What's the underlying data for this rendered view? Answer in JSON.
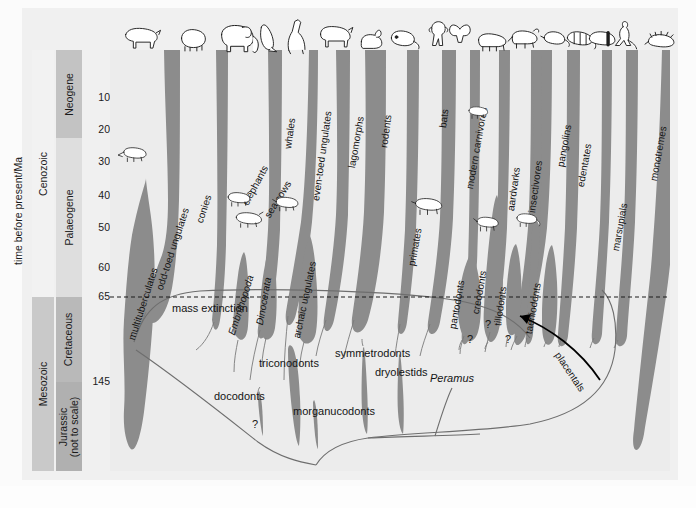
{
  "axis": {
    "title": "time before present/Ma",
    "ticks": [
      {
        "label": "10",
        "y": 48
      },
      {
        "label": "20",
        "y": 80
      },
      {
        "label": "30",
        "y": 112
      },
      {
        "label": "40",
        "y": 146
      },
      {
        "label": "50",
        "y": 178
      },
      {
        "label": "60",
        "y": 218
      },
      {
        "label": "65",
        "y": 247
      },
      {
        "label": "145",
        "y": 332
      }
    ]
  },
  "eras": [
    {
      "name": "Cenozoic"
    },
    {
      "name": "Mesozoic"
    }
  ],
  "periods": [
    {
      "name": "Neogene"
    },
    {
      "name": "Palaeogene"
    },
    {
      "name": "Cretaceous"
    },
    {
      "name": "Jurassic\n(not to scale)",
      "line1": "Jurassic",
      "line2": "(not to scale)"
    }
  ],
  "annotations": {
    "mass_extinction": "mass extinction",
    "placentals": "placentals",
    "question_marks": [
      "?",
      "?",
      "?",
      "?"
    ]
  },
  "colors": {
    "spindle": "#8c8c8c",
    "plot_background": "#ececec",
    "plate_background": "#f0f0f0",
    "neogene": "#c3c3c3",
    "palaeogene": "#dedede",
    "cretaceous": "#b9b9b9",
    "jurassic": "#b0b0b0",
    "mesozoic": "#c9c9c9",
    "cenozoic": "#f2f2f2",
    "text": "#141414",
    "boundary_line": "#1a1a1a"
  },
  "chart_data": {
    "type": "area",
    "xlabel": "",
    "ylabel": "time before present/Ma",
    "ylim": [
      0,
      145
    ],
    "grid": false,
    "legend": "none",
    "boundary_events": [
      {
        "label": "mass extinction",
        "age_ma": 65,
        "style": "dashed"
      }
    ],
    "eras": [
      {
        "name": "Cenozoic",
        "from_ma": 0,
        "to_ma": 65
      },
      {
        "name": "Mesozoic",
        "from_ma": 65,
        "to_ma": 145
      }
    ],
    "periods": [
      {
        "name": "Neogene",
        "from_ma": 0,
        "to_ma": 23
      },
      {
        "name": "Palaeogene",
        "from_ma": 23,
        "to_ma": 65
      },
      {
        "name": "Cretaceous",
        "from_ma": 65,
        "to_ma": 145
      },
      {
        "name": "Jurassic (not to scale)",
        "from_ma": 145,
        "to_ma": 200
      }
    ],
    "taxa": [
      {
        "name": "multituberculates",
        "first_ma": 145,
        "last_ma": 35,
        "icon": null
      },
      {
        "name": "odd-toed ungulates",
        "first_ma": 60,
        "last_ma": 0,
        "icon": "rhino-icon"
      },
      {
        "name": "conies",
        "first_ma": 58,
        "last_ma": 0,
        "icon": "hyrax-icon"
      },
      {
        "name": "elephants",
        "first_ma": 58,
        "last_ma": 0,
        "icon": "elephant-icon"
      },
      {
        "name": "sea cows",
        "first_ma": 55,
        "last_ma": 0,
        "icon": "seacow-icon"
      },
      {
        "name": "Embrithopoda",
        "first_ma": 55,
        "last_ma": 30,
        "icon": null
      },
      {
        "name": "Dinocerata",
        "first_ma": 60,
        "last_ma": 40,
        "icon": null
      },
      {
        "name": "archaic ungulates",
        "first_ma": 65,
        "last_ma": 40,
        "icon": null
      },
      {
        "name": "whales",
        "first_ma": 55,
        "last_ma": 0,
        "icon": "whale-icon"
      },
      {
        "name": "even-toed ungulates",
        "first_ma": 58,
        "last_ma": 0,
        "icon": "bison-icon"
      },
      {
        "name": "lagomorphs",
        "first_ma": 58,
        "last_ma": 0,
        "icon": "rabbit-icon"
      },
      {
        "name": "rodents",
        "first_ma": 60,
        "last_ma": 0,
        "icon": "rodent-icon"
      },
      {
        "name": "primates",
        "first_ma": 65,
        "last_ma": 0,
        "icon": "primate-icon"
      },
      {
        "name": "bats",
        "first_ma": 58,
        "last_ma": 0,
        "icon": "bat-icon"
      },
      {
        "name": "modern carnivores",
        "first_ma": 58,
        "last_ma": 0,
        "icon": "carnivore-icon"
      },
      {
        "name": "pantodonts",
        "first_ma": 65,
        "last_ma": 40,
        "icon": null
      },
      {
        "name": "creodonts",
        "first_ma": 65,
        "last_ma": 25,
        "icon": null
      },
      {
        "name": "tillodonts",
        "first_ma": 63,
        "last_ma": 45,
        "icon": null
      },
      {
        "name": "aardvarks",
        "first_ma": 63,
        "last_ma": 0,
        "icon": "aardvark-icon"
      },
      {
        "name": "taeniodonts",
        "first_ma": 65,
        "last_ma": 45,
        "icon": null
      },
      {
        "name": "insectivores",
        "first_ma": 65,
        "last_ma": 0,
        "icon": "shrew-icon"
      },
      {
        "name": "pangolins",
        "first_ma": 60,
        "last_ma": 0,
        "icon": "pangolin-icon"
      },
      {
        "name": "edentates",
        "first_ma": 62,
        "last_ma": 0,
        "icon": "armadillo-icon"
      },
      {
        "name": "marsupials",
        "first_ma": 100,
        "last_ma": 0,
        "icon": "kangaroo-icon"
      },
      {
        "name": "monotremes",
        "first_ma": 120,
        "last_ma": 0,
        "icon": "echidna-icon"
      },
      {
        "name": "docodonts",
        "first_ma": 180,
        "last_ma": 150,
        "icon": null
      },
      {
        "name": "triconodonts",
        "first_ma": 190,
        "last_ma": 100,
        "icon": null
      },
      {
        "name": "morganucodonts",
        "first_ma": 200,
        "last_ma": 175,
        "icon": null
      },
      {
        "name": "symmetrodonts",
        "first_ma": 180,
        "last_ma": 105,
        "icon": null
      },
      {
        "name": "dryolestids",
        "first_ma": 175,
        "last_ma": 105,
        "icon": null
      },
      {
        "name": "Peramus",
        "first_ma": 160,
        "last_ma": 140,
        "icon": null,
        "italic": true
      },
      {
        "name": "placentals",
        "first_ma": 100,
        "last_ma": 65,
        "icon": null,
        "is_arrow_label": true
      }
    ]
  },
  "spindle_labels": [
    {
      "id": "multituberculates",
      "text": "multituberculates",
      "x": 16,
      "y": 288,
      "rot": -72,
      "italic": false
    },
    {
      "id": "odd-toed-ungulates",
      "text": "odd-toed ungulates",
      "x": 44,
      "y": 238,
      "rot": -72,
      "italic": false
    },
    {
      "id": "conies",
      "text": "conies",
      "x": 84,
      "y": 171,
      "rot": -72,
      "italic": false
    },
    {
      "id": "elephants",
      "text": "elephants",
      "x": 130,
      "y": 152,
      "rot": -62,
      "italic": false
    },
    {
      "id": "sea-cows",
      "text": "sea cows",
      "x": 152,
      "y": 164,
      "rot": -58,
      "italic": false
    },
    {
      "id": "embrithopoda",
      "text": "Embrithopoda",
      "x": 116,
      "y": 283,
      "rot": -72,
      "italic": true
    },
    {
      "id": "dinocerata",
      "text": "Dinocerata",
      "x": 144,
      "y": 274,
      "rot": -80,
      "italic": true
    },
    {
      "id": "archaic-ungulates",
      "text": "archaic ungulates",
      "x": 181,
      "y": 287,
      "rot": -78,
      "italic": false
    },
    {
      "id": "whales",
      "text": "whales",
      "x": 172,
      "y": 98,
      "rot": -82,
      "italic": false
    },
    {
      "id": "even-toed-ungulates",
      "text": "even-toed ungulates",
      "x": 200,
      "y": 150,
      "rot": -82,
      "italic": false
    },
    {
      "id": "lagomorphs",
      "text": "lagomorphs",
      "x": 236,
      "y": 117,
      "rot": -80,
      "italic": false
    },
    {
      "id": "rodents",
      "text": "rodents",
      "x": 268,
      "y": 97,
      "rot": -82,
      "italic": false
    },
    {
      "id": "primates",
      "text": "primates",
      "x": 296,
      "y": 215,
      "rot": -80,
      "italic": false
    },
    {
      "id": "bats",
      "text": "bats",
      "x": 327,
      "y": 77,
      "rot": -82,
      "italic": false
    },
    {
      "id": "modern-carnivores",
      "text": "modern carnivores",
      "x": 354,
      "y": 138,
      "rot": -80,
      "italic": false
    },
    {
      "id": "pantodonts",
      "text": "pantodonts",
      "x": 337,
      "y": 278,
      "rot": -80,
      "italic": false
    },
    {
      "id": "creodonts",
      "text": "creodonts",
      "x": 360,
      "y": 263,
      "rot": -80,
      "italic": false
    },
    {
      "id": "tillodonts",
      "text": "tillodonts",
      "x": 382,
      "y": 275,
      "rot": -82,
      "italic": false
    },
    {
      "id": "aardvarks",
      "text": "aardvarks",
      "x": 395,
      "y": 160,
      "rot": -82,
      "italic": false
    },
    {
      "id": "taeniodonts",
      "text": "taeniodonts",
      "x": 413,
      "y": 283,
      "rot": -80,
      "italic": false
    },
    {
      "id": "insectivores",
      "text": "insectivores",
      "x": 416,
      "y": 162,
      "rot": -82,
      "italic": false
    },
    {
      "id": "pangolins",
      "text": "pangolins",
      "x": 445,
      "y": 116,
      "rot": -80,
      "italic": false
    },
    {
      "id": "edentates",
      "text": "edentates",
      "x": 465,
      "y": 136,
      "rot": -80,
      "italic": false
    },
    {
      "id": "marsupials",
      "text": "marsupials",
      "x": 500,
      "y": 200,
      "rot": -80,
      "italic": false
    },
    {
      "id": "monotremes",
      "text": "monotremes",
      "x": 538,
      "y": 130,
      "rot": -80,
      "italic": false
    }
  ],
  "mesozoic_labels": [
    {
      "id": "docodonts",
      "text": "docodonts",
      "x": 104,
      "y": 340,
      "italic": false
    },
    {
      "id": "triconodonts",
      "text": "triconodonts",
      "x": 149,
      "y": 307,
      "italic": false
    },
    {
      "id": "morganucodonts",
      "text": "morganucodonts",
      "x": 183,
      "y": 355,
      "italic": false
    },
    {
      "id": "symmetrodonts",
      "text": "symmetrodonts",
      "x": 225,
      "y": 297,
      "italic": false
    },
    {
      "id": "dryolestids",
      "text": "dryolestids",
      "x": 265,
      "y": 316,
      "italic": false
    },
    {
      "id": "peramus",
      "text": "Peramus",
      "x": 320,
      "y": 322,
      "italic": true
    }
  ],
  "question_marks": [
    {
      "id": "qm-docodonts",
      "x": 142,
      "y": 368
    },
    {
      "id": "qm-tillodonts",
      "x": 375,
      "y": 268
    },
    {
      "id": "qm-boundary-left",
      "x": 357,
      "y": 283
    },
    {
      "id": "qm-taeniodonts",
      "x": 395,
      "y": 283
    }
  ],
  "icons": [
    {
      "id": "rhino-icon",
      "x": 124,
      "y": 24
    },
    {
      "id": "hyrax-icon",
      "x": 179,
      "y": 26
    },
    {
      "id": "elephant-icon",
      "x": 218,
      "y": 22
    },
    {
      "id": "seacow-icon",
      "x": 262,
      "y": 22
    },
    {
      "id": "giraffe-icon",
      "x": 285,
      "y": 20
    },
    {
      "id": "bison-icon",
      "x": 320,
      "y": 24
    },
    {
      "id": "rabbit-icon",
      "x": 360,
      "y": 28
    },
    {
      "id": "rodent-icon",
      "x": 390,
      "y": 26
    },
    {
      "id": "primate-icon",
      "x": 425,
      "y": 22
    },
    {
      "id": "bat-icon",
      "x": 452,
      "y": 24
    },
    {
      "id": "carnivore-icon",
      "x": 480,
      "y": 28
    },
    {
      "id": "aardvark-icon",
      "x": 513,
      "y": 26
    },
    {
      "id": "shrew-icon",
      "x": 543,
      "y": 26
    },
    {
      "id": "pangolin-icon",
      "x": 568,
      "y": 28
    },
    {
      "id": "kangaroo-icon",
      "x": 614,
      "y": 22
    },
    {
      "id": "echidna-icon",
      "x": 650,
      "y": 28
    },
    {
      "id": "inline-multituberculate",
      "x": 120,
      "y": 148
    },
    {
      "id": "inline-embrithopod",
      "x": 228,
      "y": 192
    },
    {
      "id": "inline-dinoceratan",
      "x": 238,
      "y": 212
    },
    {
      "id": "inline-archaic-ungulate",
      "x": 277,
      "y": 196
    },
    {
      "id": "inline-carnivore-small",
      "x": 471,
      "y": 106
    },
    {
      "id": "inline-pantodont",
      "x": 417,
      "y": 198
    },
    {
      "id": "inline-tillodont",
      "x": 478,
      "y": 216
    },
    {
      "id": "inline-insectivore",
      "x": 518,
      "y": 212
    }
  ]
}
